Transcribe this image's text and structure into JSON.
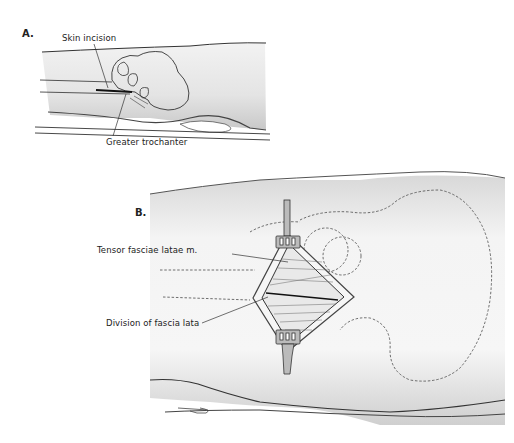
{
  "figure": {
    "panels": [
      {
        "id": "A",
        "label": "A.",
        "annotations": [
          {
            "text": "Skin incision"
          },
          {
            "text": "Greater trochanter"
          }
        ]
      },
      {
        "id": "B",
        "label": "B.",
        "annotations": [
          {
            "text": "Tensor fasciae latae m."
          },
          {
            "text": "Division of fascia lata"
          }
        ]
      }
    ],
    "colors": {
      "ink": "#222222",
      "shade": "#cfcfcf",
      "background": "#ffffff"
    }
  }
}
